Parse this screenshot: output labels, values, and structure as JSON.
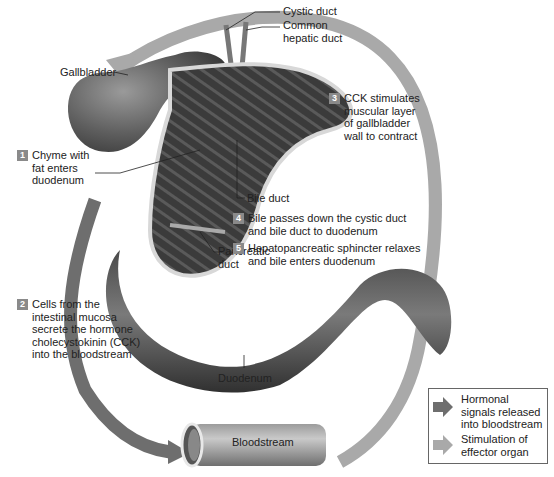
{
  "diagram": {
    "colors": {
      "hormonal_arrow": "#6e6e6e",
      "stimulation_arrow": "#a9a9a9",
      "badge": "#8a8a8a",
      "organ_dark": "#3d3d3d",
      "organ_mid": "#6b6b6b",
      "background": "#ffffff"
    },
    "labels": {
      "cystic_duct": "Cystic duct",
      "common_hepatic_duct_line1": "Common",
      "common_hepatic_duct_line2": "hepatic duct",
      "gallbladder": "Gallbladder",
      "bile_duct": "Bile duct",
      "pancreatic_duct_line1": "Pancreatic",
      "pancreatic_duct_line2": "duct",
      "duodenum": "Duodenum",
      "bloodstream": "Bloodstream"
    },
    "steps": [
      {
        "number": "1",
        "lines": [
          "Chyme with",
          "fat enters",
          "duodenum"
        ]
      },
      {
        "number": "2",
        "lines": [
          "Cells from the",
          "intestinal mucosa",
          "secrete the hormone",
          "cholecystokinin (CCK)",
          "into the bloodstream"
        ]
      },
      {
        "number": "3",
        "lines": [
          "CCK stimulates",
          "muscular layer",
          "of gallbladder",
          "wall to contract"
        ]
      },
      {
        "number": "4",
        "lines": [
          "Bile passes down the cystic duct",
          "and bile duct to duodenum"
        ]
      },
      {
        "number": "5",
        "lines": [
          "Hepatopancreatic sphincter relaxes",
          "and bile enters duodenum"
        ]
      }
    ],
    "legend": {
      "items": [
        {
          "icon": "dark-arrow-icon",
          "lines": [
            "Hormonal",
            "signals released",
            "into bloodstream"
          ]
        },
        {
          "icon": "light-arrow-icon",
          "lines": [
            "Stimulation of",
            "effector organ"
          ]
        }
      ]
    }
  }
}
